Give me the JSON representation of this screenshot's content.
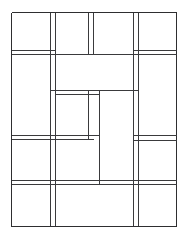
{
  "figure": {
    "title": "Rectangular partition line drawing",
    "type": "line-art-diagram",
    "canvas": {
      "width": 190,
      "height": 234
    },
    "background_color": "#ffffff",
    "line_color": "#3a3a3c",
    "outer_line_color": "#2e2e30",
    "line_width": 1,
    "style": "double-ruled-thin-lines",
    "frame": {
      "left": 11,
      "top": 12,
      "right": 176,
      "bottom": 226
    },
    "panel_count": 21,
    "vertical_rules": [
      {
        "name": "outer-left",
        "x": 11,
        "y1": 12,
        "y2": 226
      },
      {
        "name": "left-inner-a",
        "x": 50,
        "y1": 12,
        "y2": 226
      },
      {
        "name": "left-inner-b",
        "x": 55,
        "y1": 12,
        "y2": 226
      },
      {
        "name": "upper-mid-a",
        "x": 88,
        "y1": 12,
        "y2": 54
      },
      {
        "name": "upper-mid-b",
        "x": 93,
        "y1": 12,
        "y2": 54
      },
      {
        "name": "center-stub-a",
        "x": 88,
        "y1": 90,
        "y2": 139
      },
      {
        "name": "center-vertical",
        "x": 99,
        "y1": 90,
        "y2": 184
      },
      {
        "name": "right-inner-a",
        "x": 133,
        "y1": 12,
        "y2": 226
      },
      {
        "name": "right-inner-b",
        "x": 138,
        "y1": 12,
        "y2": 226
      },
      {
        "name": "outer-right",
        "x": 176,
        "y1": 12,
        "y2": 226
      }
    ],
    "horizontal_rules": [
      {
        "name": "outer-top",
        "y": 12,
        "x1": 11,
        "x2": 176
      },
      {
        "name": "band-1-upper",
        "y": 50,
        "x1": 11,
        "x2": 55
      },
      {
        "name": "band-1-lower",
        "y": 54,
        "x1": 11,
        "x2": 176
      },
      {
        "name": "band-1-right-upper",
        "y": 50,
        "x1": 133,
        "x2": 176
      },
      {
        "name": "band-2-upper",
        "y": 90,
        "x1": 50,
        "x2": 138
      },
      {
        "name": "band-2-lower",
        "y": 94,
        "x1": 55,
        "x2": 99
      },
      {
        "name": "band-3-upper",
        "y": 135,
        "x1": 11,
        "x2": 99
      },
      {
        "name": "band-3-lower",
        "y": 139,
        "x1": 11,
        "x2": 93
      },
      {
        "name": "band-3-right-upper",
        "y": 135,
        "x1": 133,
        "x2": 176
      },
      {
        "name": "band-3-right-lower",
        "y": 140,
        "x1": 133,
        "x2": 176
      },
      {
        "name": "band-4-upper",
        "y": 180,
        "x1": 11,
        "x2": 176
      },
      {
        "name": "band-4-lower",
        "y": 184,
        "x1": 11,
        "x2": 176
      },
      {
        "name": "outer-bottom",
        "y": 226,
        "x1": 11,
        "x2": 176
      }
    ]
  }
}
